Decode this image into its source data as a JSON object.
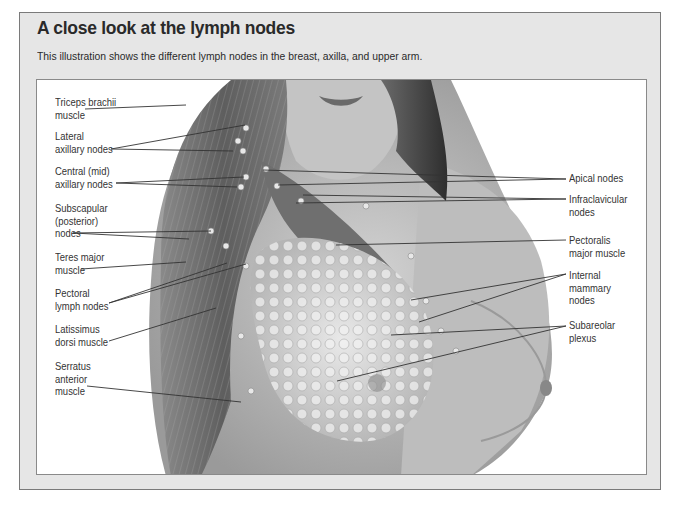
{
  "header": {
    "title": "A close look at the lymph nodes",
    "subtitle": "This illustration shows the different lymph nodes in the breast, axilla, and upper arm."
  },
  "illustration": {
    "left_labels": [
      {
        "lines": [
          "Triceps brachii",
          "muscle"
        ]
      },
      {
        "lines": [
          "Lateral",
          "axillary nodes"
        ]
      },
      {
        "lines": [
          "Central (mid)",
          "axillary nodes"
        ]
      },
      {
        "lines": [
          "Subscapular",
          "(posterior)",
          "nodes"
        ]
      },
      {
        "lines": [
          "Teres major",
          "muscle"
        ]
      },
      {
        "lines": [
          "Pectoral",
          "lymph nodes"
        ]
      },
      {
        "lines": [
          "Latissimus",
          "dorsi muscle"
        ]
      },
      {
        "lines": [
          "Serratus",
          "anterior",
          "muscle"
        ]
      }
    ],
    "right_labels": [
      {
        "lines": [
          "Apical nodes"
        ]
      },
      {
        "lines": [
          "Infraclavicular",
          "nodes"
        ]
      },
      {
        "lines": [
          "Pectoralis",
          "major muscle"
        ]
      },
      {
        "lines": [
          "Internal",
          "mammary",
          "nodes"
        ]
      },
      {
        "lines": [
          "Subareolar",
          "plexus"
        ]
      }
    ]
  },
  "colors": {
    "frame_bg": "#e6e6e6",
    "frame_border": "#7a7a7a",
    "text": "#2a2a2a",
    "leader_line": "#333333"
  }
}
